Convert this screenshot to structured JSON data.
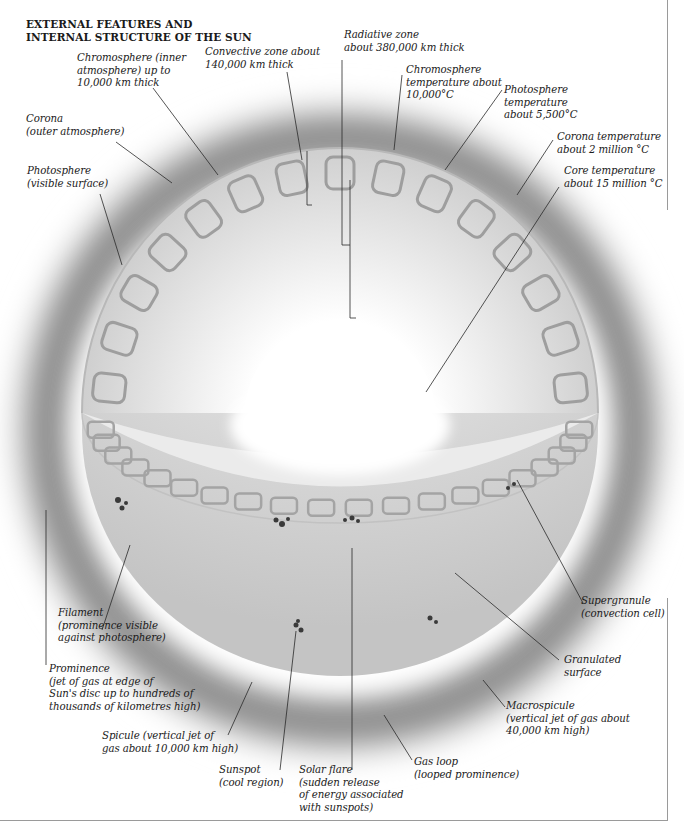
{
  "title": {
    "line1": "EXTERNAL FEATURES AND",
    "line2": "INTERNAL STRUCTURE OF THE SUN"
  },
  "labels": {
    "chromosphere_inner": [
      "Chromosphere (inner",
      "atmosphere) up to",
      "10,000 km thick"
    ],
    "convective_zone": [
      "Convective zone about",
      "140,000 km thick"
    ],
    "radiative_zone": [
      "Radiative zone",
      "about 380,000 km thick"
    ],
    "chromosphere_temp": [
      "Chromosphere",
      "temperature about",
      "10,000°C"
    ],
    "photosphere_temp": [
      "Photosphere",
      "temperature",
      "about 5,500°C"
    ],
    "corona_temp": [
      "Corona temperature",
      "about 2 million °C"
    ],
    "core_temp": [
      "Core temperature",
      "about 15 million °C"
    ],
    "corona": [
      "Corona",
      "(outer atmosphere)"
    ],
    "photosphere": [
      "Photosphere",
      "(visible surface)"
    ],
    "filament": [
      "Filament",
      "(prominence visible",
      "against photosphere)"
    ],
    "prominence": [
      "Prominence",
      "(jet of gas at edge of",
      "Sun's disc up to hundreds of",
      "thousands of kilometres high)"
    ],
    "spicule": [
      "Spicule (vertical jet of",
      "gas about 10,000 km high)"
    ],
    "sunspot": [
      "Sunspot",
      "(cool region)"
    ],
    "solar_flare": [
      "Solar flare",
      "(sudden release",
      "of energy associated",
      "with sunspots)"
    ],
    "gas_loop": [
      "Gas loop",
      "(looped prominence)"
    ],
    "macrospicule": [
      "Macrospicule",
      "(vertical jet of gas about",
      "40,000 km high)"
    ],
    "granulated_surface": [
      "Granulated",
      "surface"
    ],
    "supergranule": [
      "Supergranule",
      "(convection cell)"
    ]
  },
  "colors": {
    "corona_gray": "#8c8c8c",
    "surface_gray": "#d6d6d6",
    "cell_gray": "#9e9e9e",
    "sunspot": "#3a3a3a",
    "leader_line": "#2a2a2a",
    "core": "#ffffff"
  }
}
